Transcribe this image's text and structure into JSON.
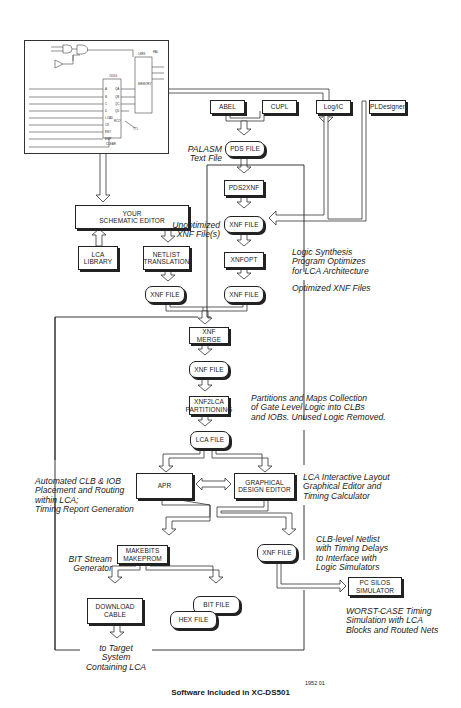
{
  "diagram": {
    "caption": "Software Included in XC-DS501",
    "figure_number": "1952 01",
    "schematic_inset": {
      "pins_left": [
        "A",
        "B",
        "C",
        "D",
        "LOAD",
        "CK",
        "ENT",
        "ENP",
        "CLEAR"
      ],
      "pins_right": [
        "QA",
        "QB",
        "QC",
        "QD",
        "RCO"
      ],
      "chip_label": "74161"
    },
    "nodes": {
      "abel": "ABEL",
      "cupl": "CUPL",
      "logic": "Log/iC",
      "pldesigner": "PLDesigner",
      "pds_file": "PDS FILE",
      "pds2xnf": "PDS2XNF",
      "xnf_file_unopt": "XNF FILE",
      "xnfopt": "XNFOPT",
      "xnf_file_opt": "XNF FILE",
      "schematic_editor": "YOUR\nSCHEMATIC EDITOR",
      "lca_library": "LCA\nLIBRARY",
      "netlist_translation": "NETLIST\nTRANSLATION",
      "xnf_file_netlist": "XNF FILE",
      "xnf_merge": "XNF MERGE",
      "xnf_file_merged": "XNF FILE",
      "xnf2lca": "XNF2LCA\nPARTITIONING",
      "lca_file": "LCA FILE",
      "apr": "APR",
      "graphical_editor": "GRAPHICAL\nDESIGN EDITOR",
      "makebits": "MAKEBITS\nMAKEPROM",
      "xnf_file_out": "XNF FILE",
      "pc_silos": "PC SILOS\nSIMULATOR",
      "download_cable": "DOWNLOAD\nCABLE",
      "bit_file": "BIT FILE",
      "hex_file": "HEX FILE"
    },
    "notes": {
      "palasm": "PALASM\nText File",
      "unoptimized": "Unoptimized\nXNF File(s)",
      "logic_synthesis": "Logic Synthesis\nProgram Optimizes\nfor LCA Architecture",
      "optimized": "Optimized XNF Files",
      "partitions": "Partitions and Maps Collection\nof Gate Level Logic into CLBs\nand IOBs.  Unused Logic Removed.",
      "automated": "Automated CLB & IOB\nPlacement and Routing\nwithin LCA;\nTiming Report Generation",
      "interactive": "LCA Interactive Layout\nGraphical Editor and\nTiming Calculator",
      "bitstream": "BIT Stream\nGenerator",
      "clb_netlist": "CLB-level Netlist\nwith Timing Delays\nto Interface with\nLogic Simulators",
      "worst_case": "WORST-CASE Timing\nSimulation with LCA\nBlocks and Routed Nets",
      "target": "to Target\nSystem\nContaining LCA"
    }
  }
}
